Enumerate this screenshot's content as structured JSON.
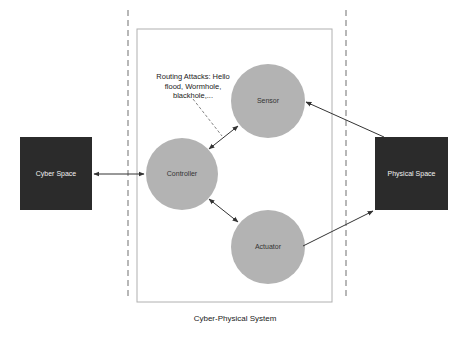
{
  "diagram": {
    "boundary_label": "Cyber-Physical System",
    "external_entities": [
      {
        "id": "cyber",
        "label": "Cyber Space"
      },
      {
        "id": "physical",
        "label": "Physical Space"
      }
    ],
    "nodes": [
      {
        "id": "controller",
        "label": "Controller"
      },
      {
        "id": "sensor",
        "label": "Sensor"
      },
      {
        "id": "actuator",
        "label": "Actuator"
      }
    ],
    "annotation": {
      "label": "Routing Attacks: Hello flood, Wormhole, blackhole,..."
    },
    "edges": [
      {
        "from": "cyber",
        "to": "controller",
        "type": "bidirectional"
      },
      {
        "from": "controller",
        "to": "sensor",
        "type": "bidirectional"
      },
      {
        "from": "controller",
        "to": "actuator",
        "type": "bidirectional"
      },
      {
        "from": "physical",
        "to": "sensor",
        "type": "directed"
      },
      {
        "from": "actuator",
        "to": "physical",
        "type": "directed"
      }
    ],
    "colors": {
      "entity_fill": "#2b2b2b",
      "node_fill": "#b3b3b3",
      "line": "#333333",
      "boundary": "#9a9a9a"
    }
  }
}
